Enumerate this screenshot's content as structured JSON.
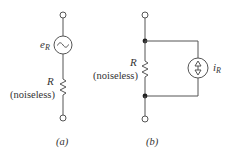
{
  "circuit_a": {
    "caption": "(a)",
    "source_label": "e",
    "source_subscript": "R",
    "resistor_label": "R",
    "resistor_note": "(noiseless)",
    "source_type": "ac-voltage-source"
  },
  "circuit_b": {
    "caption": "(b)",
    "source_label": "i",
    "source_subscript": "R",
    "resistor_label": "R",
    "resistor_note": "(noiseless)",
    "source_type": "current-source"
  },
  "colors": {
    "wire": "#555555",
    "text": "#333333",
    "background": "#ffffff"
  }
}
